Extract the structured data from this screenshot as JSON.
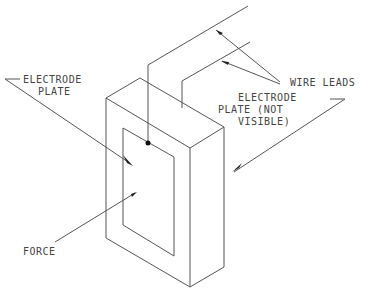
{
  "diagram": {
    "type": "isometric technical drawing",
    "colors": {
      "line": "#555555",
      "text": "#444444",
      "background": "#ffffff"
    },
    "labels": {
      "electrode_plate_front": {
        "line1": "ELECTRODE",
        "line2": "PLATE"
      },
      "wire_leads": "WIRE LEADS",
      "electrode_plate_back": {
        "line1": "ELECTRODE",
        "line2": "PLATE (NOT",
        "line3": "VISIBLE)"
      },
      "force": "FORCE"
    }
  }
}
